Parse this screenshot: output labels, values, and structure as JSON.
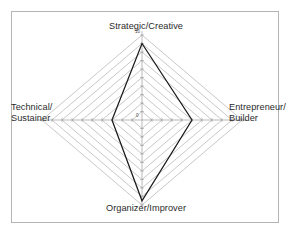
{
  "frame": {
    "border_color": "#b4b4b4",
    "background": "#ffffff"
  },
  "labels": {
    "top": "Strategic/Creative",
    "bottom": "Organizer/Improver",
    "left_line1": "Technical/",
    "left_line2": "Sustainer",
    "right_line1": "Entrepreneur/",
    "right_line2": "Builder"
  },
  "ticks": {
    "max": "10",
    "min": "0"
  },
  "colors": {
    "grid": "#9a9a9a",
    "axis": "#8a8a8a",
    "series": "#1a1a1a",
    "text": "#2b2b2b"
  },
  "chart_data": {
    "type": "radar",
    "title": "",
    "subtitle": "",
    "xlabel": "",
    "ylabel": "",
    "categories": [
      "Strategic/Creative",
      "Entrepreneur/Builder",
      "Organizer/Improver",
      "Technical/Sustainer"
    ],
    "series": [
      {
        "name": "Profile",
        "values": [
          9,
          5,
          9.5,
          3
        ]
      }
    ],
    "rings": 10,
    "ring_step": 1,
    "rlim": [
      0,
      10
    ],
    "tick_labels": [
      "0",
      "10"
    ],
    "grid": true,
    "grid_shape": "diamond",
    "legend": false,
    "legend_position": "none",
    "axis_order": "clockwise-from-top",
    "annotations": []
  },
  "geometry": {
    "center_x": 142,
    "center_y": 120,
    "radius_x": 100,
    "radius_y": 85
  }
}
